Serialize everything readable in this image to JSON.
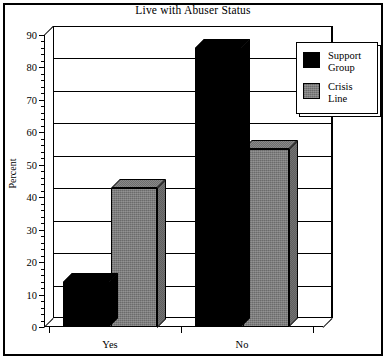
{
  "chart_data": {
    "type": "bar",
    "title": "Live with Abuser Status",
    "xlabel": "",
    "ylabel": "Percent",
    "categories": [
      "Yes",
      "No"
    ],
    "series": [
      {
        "name": "Support Group",
        "values": [
          14,
          86
        ],
        "color": "#000000"
      },
      {
        "name": "Crisis Line",
        "values": [
          43,
          55
        ],
        "color": "#7d7d7d"
      }
    ],
    "ylim": [
      0,
      90
    ],
    "ytick_labels": [
      "0",
      "10",
      "20",
      "30",
      "40",
      "50",
      "60",
      "70",
      "80",
      "90"
    ],
    "ytick_values": [
      0,
      10,
      20,
      30,
      40,
      50,
      60,
      70,
      80,
      90
    ],
    "grid": true,
    "legend_position": "top-right",
    "style": "3d-bars"
  },
  "legend": {
    "items": [
      {
        "label": "Support\nGroup",
        "swatch": "swatch-support"
      },
      {
        "label": "Crisis\nLine",
        "swatch": "swatch-crisis"
      }
    ]
  }
}
